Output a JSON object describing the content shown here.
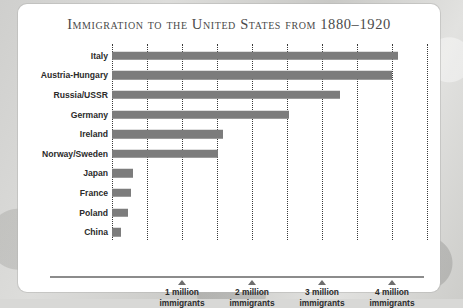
{
  "card": {
    "background_color": "#ffffff",
    "page_background_color": "#d3d3d1"
  },
  "chart_data": {
    "type": "bar",
    "orientation": "horizontal",
    "title": "Immigration to the United States from 1880–1920",
    "xlabel": "",
    "ylabel": "",
    "unit": "millions of immigrants",
    "xlim": [
      0,
      4.6
    ],
    "grid": true,
    "grid_interval": 0.5,
    "legend": "none",
    "bar_color": "#7c7c7c",
    "categories": [
      "Italy",
      "Austria-Hungary",
      "Russia/USSR",
      "Germany",
      "Ireland",
      "Norway/Sweden",
      "Japan",
      "France",
      "Poland",
      "China"
    ],
    "values": [
      4.09,
      4.0,
      3.25,
      2.53,
      1.59,
      1.51,
      0.3,
      0.27,
      0.23,
      0.13
    ],
    "xticks": [
      1,
      2,
      3,
      4
    ],
    "xtick_labels": [
      {
        "line1": "1 million",
        "line2": "immigrants"
      },
      {
        "line1": "2 million",
        "line2": "immigrants"
      },
      {
        "line1": "3 million",
        "line2": "immigrants"
      },
      {
        "line1": "4 million",
        "line2": "immigrants"
      }
    ]
  }
}
